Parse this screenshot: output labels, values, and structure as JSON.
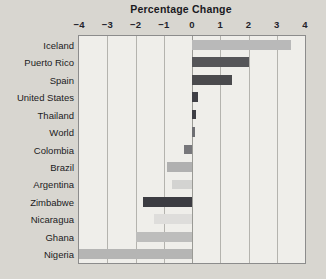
{
  "chart_data": {
    "type": "bar",
    "orientation": "horizontal",
    "title": "Percentage Change",
    "xlabel": "",
    "ylabel": "",
    "xlim": [
      -4,
      4
    ],
    "xticks": [
      -4,
      -3,
      -2,
      -1,
      0,
      1,
      2,
      3,
      4
    ],
    "xticklabels": [
      "−4",
      "−3",
      "−2",
      "−1",
      "0",
      "1",
      "2",
      "3",
      "4"
    ],
    "grid": true,
    "legend": false,
    "categories": [
      "Iceland",
      "Puerto Rico",
      "Spain",
      "United States",
      "Thailand",
      "World",
      "Colombia",
      "Brazil",
      "Argentina",
      "Zimbabwe",
      "Nicaragua",
      "Ghana",
      "Nigeria"
    ],
    "values": [
      3.5,
      2.0,
      1.4,
      0.2,
      0.15,
      0.1,
      -0.3,
      -0.9,
      -0.7,
      -1.75,
      -1.35,
      -2.0,
      -4.0
    ],
    "bar_colors": [
      "#b9b9b9",
      "#555558",
      "#4a4a4d",
      "#3f3f45",
      "#3f3f45",
      "#6e6e72",
      "#77777b",
      "#b0b0b0",
      "#d3d3d1",
      "#3c3c42",
      "#dedddb",
      "#bdbdbc",
      "#b5b5b4"
    ]
  },
  "figure": {
    "background_color": "#d8d6d0",
    "plot_background_color": "#efeeea",
    "plot_border_color": "#8c8c8c",
    "gridline_color": "#b4b3ae",
    "title_color": "#1a1a22"
  }
}
